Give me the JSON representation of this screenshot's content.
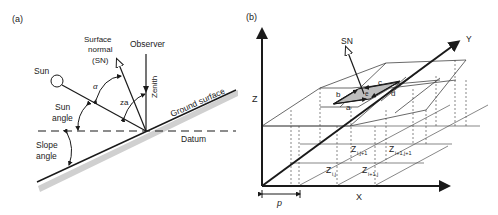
{
  "panel_a": {
    "tag": "(a)",
    "labels": {
      "sun": "Sun",
      "surface_normal_1": "Surface",
      "surface_normal_2": "normal",
      "surface_normal_3": "(SN)",
      "observer": "Observer",
      "zenith": "Zenith",
      "alpha": "α",
      "za": "za",
      "sun_angle_1": "Sun",
      "sun_angle_2": "angle",
      "slope_angle_1": "Slope",
      "slope_angle_2": "angle",
      "ground_surface": "Ground surface",
      "datum": "Datum"
    }
  },
  "panel_b": {
    "tag": "(b)",
    "labels": {
      "sn": "SN",
      "y_axis": "Y",
      "z_axis": "Z",
      "x_axis": "X",
      "p": "p",
      "a": "a",
      "b": "b",
      "c": "c",
      "d": "d",
      "e": "e",
      "z_ij": "Z",
      "z_ij_sub": "i,j",
      "z_ij1": "Z",
      "z_ij1_sub": "i,j+1",
      "z_i1j": "Z",
      "z_i1j_sub": "i+1,j",
      "z_i1j1": "Z",
      "z_i1j1_sub": "i+1,j+1"
    }
  },
  "colors": {
    "line": "#1a1a1a",
    "grid": "#555555",
    "shade": "#bdbdbd",
    "ground_shadow": "#d0d0d0"
  }
}
